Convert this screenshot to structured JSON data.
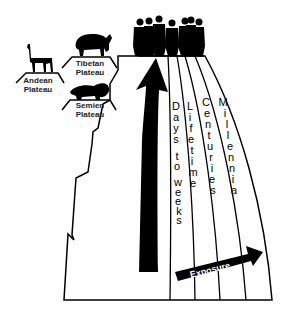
{
  "colors": {
    "ink": "#000000",
    "background": "#ffffff",
    "arrow_text": "#ffffff"
  },
  "plateaus": [
    {
      "name": "Andean",
      "line2": "Plateau",
      "animal": "llama-icon"
    },
    {
      "name": "Tibetan",
      "line2": "Plateau",
      "animal": "yak-icon"
    },
    {
      "name": "Semien",
      "line2": "Plateau",
      "animal": "gelada-icon"
    }
  ],
  "summit": {
    "figure": "people-group-icon"
  },
  "axes": {
    "altitude": {
      "label": "Altitude",
      "letters": [
        "A",
        "l",
        "t",
        "i",
        "t",
        "u",
        "d",
        "e"
      ]
    },
    "exposure": {
      "label": "Exposure"
    }
  },
  "time_bands": [
    {
      "label": "Days to weeks",
      "letters": [
        "D",
        "a",
        "y",
        "s",
        "",
        "t",
        "o",
        "",
        "w",
        "e",
        "e",
        "k",
        "s"
      ]
    },
    {
      "label": "Lifetime",
      "letters": [
        "L",
        "i",
        "f",
        "e",
        "t",
        "i",
        "m",
        "e"
      ]
    },
    {
      "label": "Centuries",
      "letters": [
        "C",
        "e",
        "n",
        "t",
        "u",
        "r",
        "i",
        "e",
        "s"
      ]
    },
    {
      "label": "Millennia",
      "letters": [
        "M",
        "i",
        "l",
        "l",
        "e",
        "n",
        "n",
        "i",
        "a"
      ]
    }
  ]
}
